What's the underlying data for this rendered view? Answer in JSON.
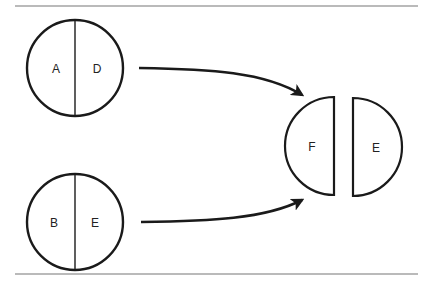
{
  "diagram": {
    "circles": [
      {
        "id": "circle-top",
        "left_label": "A",
        "right_label": "D"
      },
      {
        "id": "circle-bottom",
        "left_label": "B",
        "right_label": "E"
      }
    ],
    "result": {
      "left_half_label": "F",
      "right_half_label": "E"
    },
    "arrows": [
      {
        "from": "circle-top",
        "to": "result"
      },
      {
        "from": "circle-bottom",
        "to": "result"
      }
    ],
    "colors": {
      "stroke": "#1a1a1a",
      "rule": "#777777",
      "background": "#ffffff"
    }
  }
}
